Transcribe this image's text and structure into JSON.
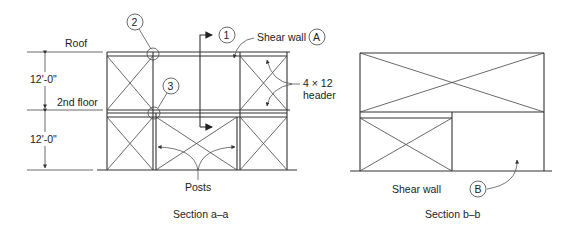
{
  "diagram": {
    "section_aa": {
      "caption": "Section a–a",
      "labels": {
        "roof": "Roof",
        "second_floor": "2nd floor",
        "upper_height": "12'-0\"",
        "lower_height": "12'-0\"",
        "posts": "Posts",
        "shear_wall": "Shear wall",
        "shear_wall_tag": "A",
        "header_line1": "4 × 12",
        "header_line2": "header"
      },
      "callouts": [
        {
          "id": "1",
          "label": "1"
        },
        {
          "id": "2",
          "label": "2"
        },
        {
          "id": "3",
          "label": "3"
        }
      ]
    },
    "section_bb": {
      "caption": "Section b–b",
      "labels": {
        "shear_wall": "Shear wall",
        "shear_wall_tag": "B"
      }
    }
  }
}
